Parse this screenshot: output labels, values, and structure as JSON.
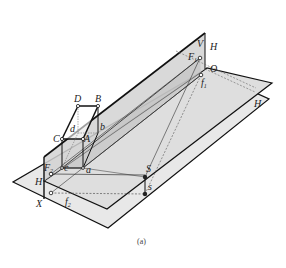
{
  "figure": {
    "caption": "(a)",
    "colors": {
      "background": "#ffffff",
      "plane_fill_lower": "#e6e6e6",
      "plane_fill_upper": "#dadada",
      "plane_fill_picture": "#cfcfcf",
      "band_fill": "#c4c4c4",
      "line": "#111111",
      "thin_line": "#555555"
    },
    "planes": [
      {
        "name": "V",
        "label": "V"
      },
      {
        "name": "H-upper",
        "label": "H"
      },
      {
        "name": "H-lower",
        "label": "H"
      },
      {
        "name": "H-left",
        "label": "H"
      }
    ],
    "labels": {
      "V": "V",
      "H_top": "H",
      "H_right": "H",
      "H_left": "H",
      "O": "O",
      "X": "X",
      "F1": "F",
      "F1_sub": "1",
      "f1": "f",
      "f1_sub": "1",
      "F2": "F",
      "F2_sub": "2",
      "f2": "f",
      "f2_sub": "2",
      "S": "S",
      "s": "s",
      "A": "A",
      "B": "B",
      "C": "C",
      "D": "D",
      "a": "a",
      "b": "b",
      "c": "c",
      "d": "d"
    }
  }
}
